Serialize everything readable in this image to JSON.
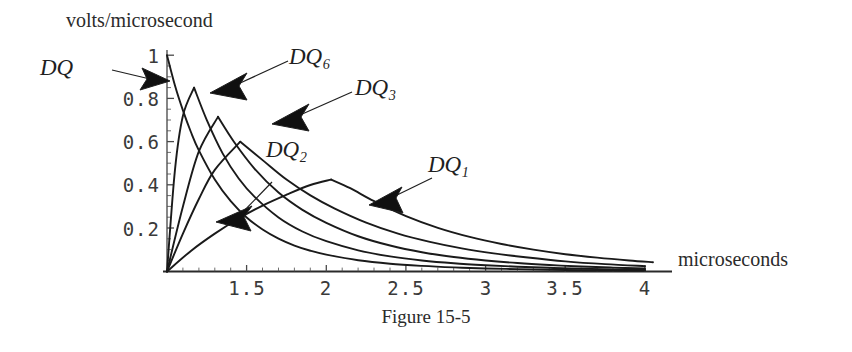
{
  "figure": {
    "caption": "Figure 15-5"
  },
  "chart_data": {
    "type": "line",
    "title": "",
    "xlabel": "microseconds",
    "ylabel": "volts/microsecond",
    "xlim": [
      1,
      4.12
    ],
    "ylim": [
      0,
      1.05
    ],
    "grid": false,
    "legend_position": "inline-annotations",
    "xticks": [
      1.5,
      2,
      2.5,
      3,
      3.5,
      4
    ],
    "xtick_labels": [
      "1.5",
      "2",
      "2.5",
      "3",
      "3.5",
      "4"
    ],
    "yticks": [
      0.2,
      0.4,
      0.6,
      0.8,
      1
    ],
    "ytick_labels": [
      "0.2",
      "0.4",
      "0.6",
      "0.8",
      "1"
    ],
    "x_minor_tick_step": 0.1,
    "y_minor_tick_step": 0.05,
    "annotations": [
      {
        "text": "DQ",
        "subscript": "",
        "points_to": "peak of DQ curve at x=1, y=1"
      },
      {
        "text": "DQ",
        "subscript": "6",
        "points_to": "peak of DQ6 curve"
      },
      {
        "text": "DQ",
        "subscript": "3",
        "points_to": "peak of DQ3 curve"
      },
      {
        "text": "DQ",
        "subscript": "2",
        "points_to": "peak of DQ2 curve"
      },
      {
        "text": "DQ",
        "subscript": "1",
        "points_to": "rising flank of DQ1 curve"
      }
    ],
    "series": [
      {
        "name": "DQ",
        "peak_x": 1.0,
        "peak_y": 1.0,
        "x": [
          1.0,
          1.05,
          1.1,
          1.15,
          1.2,
          1.3,
          1.4,
          1.5,
          1.6,
          1.7,
          1.8,
          1.9,
          2.0,
          2.2,
          2.4,
          2.6,
          2.8,
          3.0,
          3.2,
          3.4,
          3.6,
          3.8,
          4.0
        ],
        "values": [
          1.0,
          0.86,
          0.745,
          0.645,
          0.56,
          0.425,
          0.325,
          0.25,
          0.194,
          0.152,
          0.12,
          0.096,
          0.078,
          0.052,
          0.036,
          0.026,
          0.019,
          0.014,
          0.011,
          0.008,
          0.006,
          0.005,
          0.004
        ]
      },
      {
        "name": "DQ6",
        "peak_x": 1.17,
        "peak_y": 0.85,
        "x": [
          1.0,
          1.05,
          1.1,
          1.17,
          1.25,
          1.35,
          1.45,
          1.55,
          1.7,
          1.85,
          2.0,
          2.2,
          2.4,
          2.6,
          2.8,
          3.0,
          3.2,
          3.4,
          3.6,
          3.8,
          4.0
        ],
        "values": [
          0.0,
          0.47,
          0.72,
          0.85,
          0.7,
          0.545,
          0.43,
          0.345,
          0.25,
          0.185,
          0.14,
          0.098,
          0.07,
          0.051,
          0.038,
          0.029,
          0.022,
          0.017,
          0.013,
          0.01,
          0.008
        ]
      },
      {
        "name": "DQ3",
        "peak_x": 1.32,
        "peak_y": 0.715,
        "x": [
          1.0,
          1.1,
          1.2,
          1.32,
          1.42,
          1.55,
          1.7,
          1.85,
          2.0,
          2.2,
          2.4,
          2.6,
          2.8,
          3.0,
          3.2,
          3.4,
          3.6,
          3.8,
          4.0
        ],
        "values": [
          0.0,
          0.3,
          0.555,
          0.715,
          0.6,
          0.475,
          0.365,
          0.285,
          0.225,
          0.163,
          0.12,
          0.089,
          0.067,
          0.051,
          0.039,
          0.03,
          0.023,
          0.018,
          0.014
        ]
      },
      {
        "name": "DQ2",
        "peak_x": 1.46,
        "peak_y": 0.6,
        "x": [
          1.0,
          1.1,
          1.2,
          1.3,
          1.46,
          1.6,
          1.75,
          1.9,
          2.05,
          2.25,
          2.45,
          2.65,
          2.85,
          3.05,
          3.25,
          3.5,
          3.75,
          4.0
        ],
        "values": [
          0.0,
          0.175,
          0.335,
          0.47,
          0.6,
          0.515,
          0.425,
          0.352,
          0.292,
          0.226,
          0.175,
          0.137,
          0.107,
          0.084,
          0.066,
          0.047,
          0.034,
          0.025
        ]
      },
      {
        "name": "DQ1",
        "peak_x": 2.03,
        "peak_y": 0.425,
        "x": [
          1.0,
          1.15,
          1.3,
          1.45,
          1.6,
          1.75,
          1.9,
          2.03,
          2.15,
          2.3,
          2.5,
          2.7,
          2.9,
          3.1,
          3.3,
          3.5,
          3.7,
          3.9,
          4.05
        ],
        "values": [
          0.0,
          0.095,
          0.175,
          0.245,
          0.305,
          0.355,
          0.4,
          0.425,
          0.385,
          0.325,
          0.256,
          0.202,
          0.16,
          0.127,
          0.101,
          0.08,
          0.064,
          0.051,
          0.043
        ]
      }
    ]
  },
  "axes": {
    "x_axis_name": "microseconds",
    "y_axis_name": "volts/microsecond"
  },
  "colors": {
    "curve": "#1a1a1a",
    "axis": "#3a3a3a",
    "text": "#2b2b2b",
    "background": "#ffffff"
  }
}
